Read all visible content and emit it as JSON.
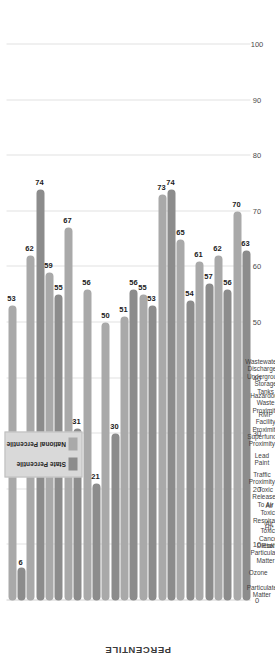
{
  "chart_data": {
    "type": "bar",
    "orientation": "vertical-rotated",
    "title": "",
    "xlabel": "",
    "ylabel": "PERCENTILE",
    "ylim": [
      0,
      100
    ],
    "ticks": [
      "100",
      "90",
      "80",
      "70",
      "60",
      "50",
      "40",
      "30",
      "20",
      "10",
      "0"
    ],
    "tick_values": [
      100,
      90,
      80,
      70,
      60,
      50,
      40,
      30,
      20,
      10,
      0
    ],
    "grid": true,
    "legend_position": "top-right",
    "categories": [
      "Particulate Matter",
      "Ozone",
      "Diesel Particulate Matter",
      "Air Toxics Cancer Risk*",
      "Air Toxics Respiratory HI*",
      "Toxic Releases To Air",
      "Traffic Proximity",
      "Lead Paint",
      "Superfund Proximity",
      "RMP Facility Proximity",
      "Hazardous Waste Proximity",
      "Underground Storage Tanks",
      "Wastewater Discharge"
    ],
    "category_lines": [
      [
        "Particulate",
        "Matter"
      ],
      [
        "Ozone"
      ],
      [
        "Diesel",
        "Particulate",
        "Matter"
      ],
      [
        "Air",
        "Toxics",
        "Cancer",
        "Risk*"
      ],
      [
        "Air",
        "Toxics",
        "Respiratory",
        "HI*"
      ],
      [
        "Toxic",
        "Releases",
        "To Air"
      ],
      [
        "Traffic",
        "Proximity"
      ],
      [
        "Lead",
        "Paint"
      ],
      [
        "Superfund",
        "Proximity"
      ],
      [
        "RMP",
        "Facility",
        "Proximity"
      ],
      [
        "Hazardous",
        "Waste",
        "Proximity"
      ],
      [
        "Underground",
        "Storage",
        "Tanks"
      ],
      [
        "Wastewater",
        "Discharge"
      ]
    ],
    "series": [
      {
        "name": "State Percentile",
        "color": "#8c8c8c",
        "values": [
          6,
          74,
          55,
          31,
          21,
          30,
          56,
          53,
          74,
          54,
          57,
          56,
          63
        ]
      },
      {
        "name": "National Percentile",
        "color": "#a9a9a9",
        "values": [
          53,
          62,
          59,
          67,
          56,
          50,
          51,
          55,
          73,
          65,
          61,
          62,
          70
        ]
      }
    ]
  },
  "legend": {
    "items": [
      {
        "label": "State Percentile",
        "color": "#8c8c8c"
      },
      {
        "label": "National Percentile",
        "color": "#a9a9a9"
      }
    ]
  },
  "axis": {
    "value_axis_title": "PERCENTILE"
  }
}
